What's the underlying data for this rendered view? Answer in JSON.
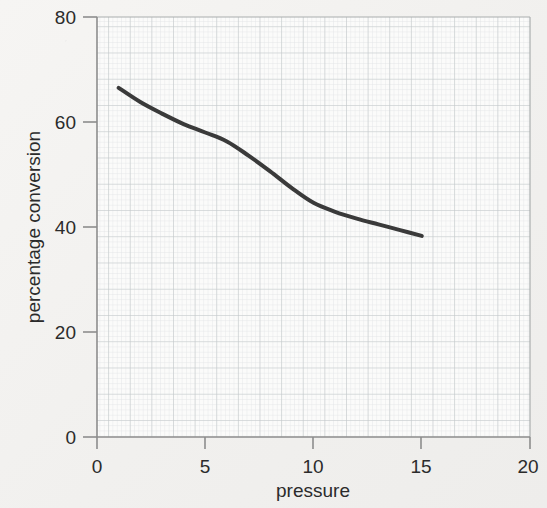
{
  "chart_data": {
    "type": "line",
    "title": "",
    "subtitle": "",
    "xlabel": "pressure",
    "ylabel": "percentage conversion",
    "xlim": [
      0,
      20
    ],
    "ylim": [
      0,
      80
    ],
    "xticks": [
      0,
      5,
      10,
      15,
      20
    ],
    "yticks": [
      0,
      20,
      40,
      60,
      80
    ],
    "xtick_labels": [
      "0",
      "5",
      "10",
      "15",
      "20"
    ],
    "ytick_labels": [
      "0",
      "20",
      "40",
      "60",
      "80"
    ],
    "grid": true,
    "grid_minor": true,
    "legend": false,
    "legend_position": "none",
    "annotations": [],
    "series": [
      {
        "name": "percentage conversion vs pressure",
        "color": "#3a3a3a",
        "line_width": 4,
        "marker": "none",
        "x": [
          1.0,
          2.0,
          3.0,
          4.0,
          5.0,
          6.0,
          7.0,
          8.0,
          9.0,
          10.0,
          11.0,
          12.0,
          13.0,
          14.0,
          15.0
        ],
        "y": [
          66.5,
          63.8,
          61.6,
          59.6,
          58.0,
          56.3,
          53.6,
          50.6,
          47.4,
          44.6,
          42.9,
          41.6,
          40.5,
          39.4,
          38.3
        ]
      }
    ]
  },
  "axes": {
    "x_tick_label_texts": [
      "0",
      "5",
      "10",
      "15",
      "20"
    ],
    "y_tick_label_texts": [
      "0",
      "20",
      "40",
      "60",
      "80"
    ],
    "x_axis_title": "pressure",
    "y_axis_title": "percentage conversion"
  },
  "colors": {
    "curve": "#3a3a3a",
    "axis": "#8d8d8d",
    "grid_major": "#c2c7c9",
    "grid_minor": "#dfe3e4",
    "text": "#2b2b2b",
    "paper": "#f4f3f1"
  }
}
